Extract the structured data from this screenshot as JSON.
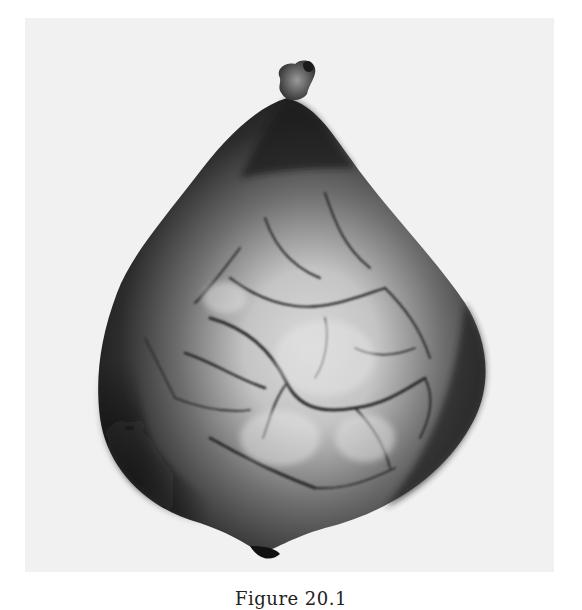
{
  "figure": {
    "caption": "Figure 20.1",
    "photo": {
      "subject": "specimen-photograph",
      "description": "Grayscale photograph of a pear-shaped specimen with a small stalk at the top and a network of surface vessels",
      "background_color": "#f1f1f1",
      "specimen_dark_color": "#1e1e1e",
      "specimen_light_color": "#d9d9d9"
    }
  }
}
